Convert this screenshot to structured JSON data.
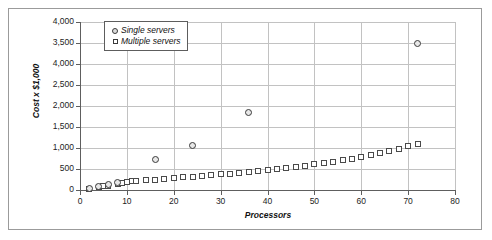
{
  "chart_data": {
    "type": "scatter",
    "title": "",
    "xlabel": "Processors",
    "ylabel": "Cost x $1,000",
    "xlim": [
      0,
      80
    ],
    "ylim": [
      0,
      4000
    ],
    "grid": true,
    "legend_position": "top-left",
    "xticks": [
      0,
      10,
      20,
      30,
      40,
      50,
      60,
      70,
      80
    ],
    "xtick_labels": [
      "0",
      "10",
      "20",
      "30",
      "40",
      "50",
      "60",
      "70",
      "80"
    ],
    "yticks": [
      0,
      500,
      1000,
      1500,
      2000,
      2500,
      3000,
      3500,
      4000
    ],
    "ytick_labels": [
      "0",
      "500",
      "1,000",
      "1,500",
      "2,000",
      "2,500",
      "4,000",
      "3,500",
      "4,000"
    ],
    "series": [
      {
        "name": "Single servers",
        "marker": "circle",
        "color": "#3a3a3a",
        "points": [
          {
            "x": 2,
            "y": 40
          },
          {
            "x": 4,
            "y": 90
          },
          {
            "x": 6,
            "y": 130
          },
          {
            "x": 8,
            "y": 175
          },
          {
            "x": 16,
            "y": 730
          },
          {
            "x": 24,
            "y": 1050
          },
          {
            "x": 36,
            "y": 1850
          },
          {
            "x": 72,
            "y": 3500
          }
        ]
      },
      {
        "name": "Multiple servers",
        "marker": "square",
        "color": "#4a4a4a",
        "points": [
          {
            "x": 2,
            "y": 30
          },
          {
            "x": 4,
            "y": 60
          },
          {
            "x": 5,
            "y": 85
          },
          {
            "x": 6,
            "y": 100
          },
          {
            "x": 8,
            "y": 150
          },
          {
            "x": 9,
            "y": 165
          },
          {
            "x": 10,
            "y": 195
          },
          {
            "x": 11,
            "y": 205
          },
          {
            "x": 12,
            "y": 215
          },
          {
            "x": 14,
            "y": 230
          },
          {
            "x": 16,
            "y": 245
          },
          {
            "x": 18,
            "y": 260
          },
          {
            "x": 20,
            "y": 275
          },
          {
            "x": 22,
            "y": 300
          },
          {
            "x": 24,
            "y": 315
          },
          {
            "x": 26,
            "y": 330
          },
          {
            "x": 28,
            "y": 350
          },
          {
            "x": 30,
            "y": 370
          },
          {
            "x": 32,
            "y": 390
          },
          {
            "x": 34,
            "y": 410
          },
          {
            "x": 36,
            "y": 430
          },
          {
            "x": 38,
            "y": 450
          },
          {
            "x": 40,
            "y": 470
          },
          {
            "x": 42,
            "y": 500
          },
          {
            "x": 44,
            "y": 525
          },
          {
            "x": 46,
            "y": 550
          },
          {
            "x": 48,
            "y": 580
          },
          {
            "x": 50,
            "y": 610
          },
          {
            "x": 52,
            "y": 640
          },
          {
            "x": 54,
            "y": 675
          },
          {
            "x": 56,
            "y": 710
          },
          {
            "x": 58,
            "y": 750
          },
          {
            "x": 60,
            "y": 790
          },
          {
            "x": 62,
            "y": 830
          },
          {
            "x": 64,
            "y": 880
          },
          {
            "x": 66,
            "y": 930
          },
          {
            "x": 68,
            "y": 985
          },
          {
            "x": 70,
            "y": 1040
          },
          {
            "x": 72,
            "y": 1095
          }
        ]
      }
    ]
  }
}
